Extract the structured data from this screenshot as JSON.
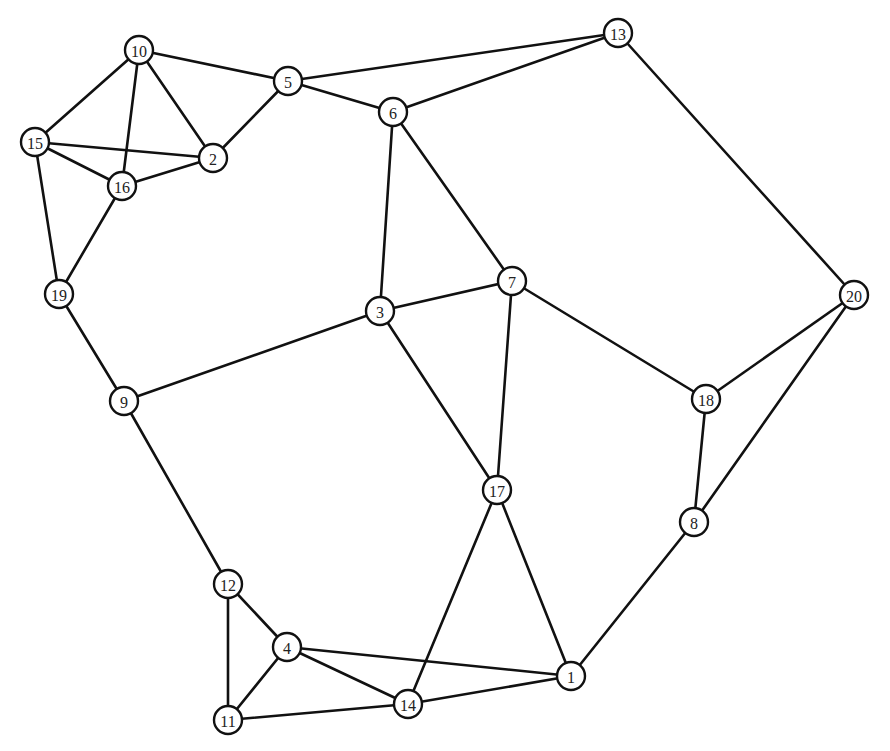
{
  "graph": {
    "node_radius": 14,
    "colors": {
      "stroke": "#111111",
      "fill": "#ffffff",
      "text": "#222222"
    },
    "nodes": [
      {
        "id": "1",
        "x": 571,
        "y": 676
      },
      {
        "id": "2",
        "x": 213,
        "y": 158
      },
      {
        "id": "3",
        "x": 380,
        "y": 311
      },
      {
        "id": "4",
        "x": 287,
        "y": 647
      },
      {
        "id": "5",
        "x": 288,
        "y": 81
      },
      {
        "id": "6",
        "x": 393,
        "y": 112
      },
      {
        "id": "7",
        "x": 512,
        "y": 281
      },
      {
        "id": "8",
        "x": 694,
        "y": 522
      },
      {
        "id": "9",
        "x": 124,
        "y": 401
      },
      {
        "id": "10",
        "x": 139,
        "y": 50
      },
      {
        "id": "11",
        "x": 228,
        "y": 720
      },
      {
        "id": "12",
        "x": 228,
        "y": 584
      },
      {
        "id": "13",
        "x": 618,
        "y": 33
      },
      {
        "id": "14",
        "x": 408,
        "y": 704
      },
      {
        "id": "15",
        "x": 35,
        "y": 142
      },
      {
        "id": "16",
        "x": 122,
        "y": 186
      },
      {
        "id": "17",
        "x": 497,
        "y": 490
      },
      {
        "id": "18",
        "x": 706,
        "y": 399
      },
      {
        "id": "19",
        "x": 59,
        "y": 294
      },
      {
        "id": "20",
        "x": 854,
        "y": 295
      }
    ],
    "edges": [
      [
        "10",
        "5"
      ],
      [
        "10",
        "15"
      ],
      [
        "10",
        "16"
      ],
      [
        "10",
        "2"
      ],
      [
        "15",
        "2"
      ],
      [
        "15",
        "16"
      ],
      [
        "15",
        "19"
      ],
      [
        "16",
        "2"
      ],
      [
        "16",
        "19"
      ],
      [
        "2",
        "5"
      ],
      [
        "5",
        "13"
      ],
      [
        "5",
        "6"
      ],
      [
        "6",
        "13"
      ],
      [
        "6",
        "3"
      ],
      [
        "6",
        "7"
      ],
      [
        "13",
        "20"
      ],
      [
        "3",
        "7"
      ],
      [
        "3",
        "9"
      ],
      [
        "3",
        "17"
      ],
      [
        "7",
        "17"
      ],
      [
        "7",
        "18"
      ],
      [
        "19",
        "9"
      ],
      [
        "9",
        "12"
      ],
      [
        "20",
        "18"
      ],
      [
        "20",
        "8"
      ],
      [
        "18",
        "8"
      ],
      [
        "8",
        "1"
      ],
      [
        "17",
        "14"
      ],
      [
        "17",
        "1"
      ],
      [
        "12",
        "4"
      ],
      [
        "12",
        "11"
      ],
      [
        "4",
        "11"
      ],
      [
        "4",
        "14"
      ],
      [
        "4",
        "1"
      ],
      [
        "11",
        "14"
      ],
      [
        "14",
        "1"
      ]
    ]
  }
}
